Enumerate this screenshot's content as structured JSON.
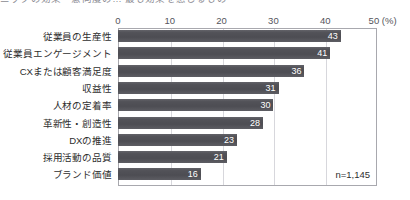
{
  "clipped_header": "ニックの効果・意向度の… 最も効果を感じるもの",
  "chart_data": {
    "type": "bar",
    "orientation": "horizontal",
    "title": "",
    "xlabel": "(%)",
    "ylabel": "",
    "xlim": [
      0,
      50
    ],
    "xticks": [
      0,
      10,
      20,
      30,
      40,
      50
    ],
    "xtick_labels": [
      "0",
      "10",
      "20",
      "30",
      "40",
      "50"
    ],
    "x_unit_label": "(%)",
    "grid": true,
    "grid_axis": "x",
    "legend": false,
    "annotation": "n=1,145",
    "bar_color": "#52525a",
    "value_label_color": "#ffffff",
    "categories": [
      "従業員の生産性",
      "従業員エンゲージメント",
      "CXまたは顧客満足度",
      "収益性",
      "人材の定着率",
      "革新性・創造性",
      "DXの推進",
      "採用活動の品質",
      "ブランド価値"
    ],
    "values": [
      43,
      41,
      36,
      31,
      30,
      28,
      23,
      21,
      16
    ]
  }
}
